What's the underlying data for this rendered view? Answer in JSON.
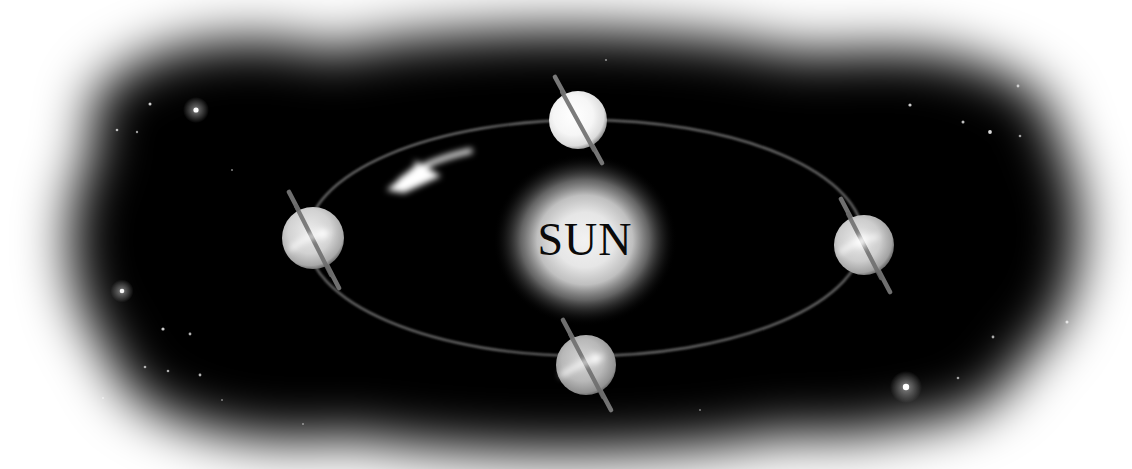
{
  "diagram": {
    "background_color": "#ffffff",
    "space_color": "#000000",
    "sun": {
      "label": "SUN",
      "label_color": "#0a0a0a",
      "cx": 585,
      "cy": 240,
      "core_radius": 52,
      "glow_radius": 92,
      "core_color": "#e8e8e8",
      "glow_color": "#000000"
    },
    "orbit": {
      "name": "orbital-path",
      "cx": 585,
      "cy": 238,
      "rx": 278,
      "ry": 118,
      "stroke_color": "#6d6d6d",
      "stroke_width": 2.4
    },
    "orbit_direction_arrow": {
      "name": "orbit-direction-arrow",
      "label": "counterclockwise",
      "color": "#ffffff"
    },
    "planets": [
      {
        "name": "planet-top",
        "position": "top",
        "cx": 578,
        "cy": 120,
        "r": 29,
        "body_color": "#fdfdfd",
        "axis_color": "#767676",
        "axis_tilt_deg": 22,
        "has_rotation_arrow": false
      },
      {
        "name": "planet-left",
        "position": "left",
        "cx": 313,
        "cy": 238,
        "r": 31,
        "body_color": "#d3d3d3",
        "axis_color": "#6f6f6f",
        "axis_tilt_deg": 22,
        "has_rotation_arrow": true
      },
      {
        "name": "planet-bottom",
        "position": "bottom",
        "cx": 586,
        "cy": 365,
        "r": 30,
        "body_color": "#b6b6b6",
        "axis_color": "#6f6f6f",
        "axis_tilt_deg": 22,
        "has_rotation_arrow": true
      },
      {
        "name": "planet-right",
        "position": "right",
        "cx": 864,
        "cy": 245,
        "r": 30,
        "body_color": "#cfcfcf",
        "axis_color": "#6f6f6f",
        "axis_tilt_deg": 22,
        "has_rotation_arrow": true
      }
    ],
    "stars": [
      {
        "x": 196,
        "y": 110,
        "r": 2.6,
        "bright": 1.0
      },
      {
        "x": 150,
        "y": 104,
        "r": 1.5,
        "bright": 0.8
      },
      {
        "x": 117,
        "y": 130,
        "r": 1.3,
        "bright": 0.7
      },
      {
        "x": 137,
        "y": 132,
        "r": 1.2,
        "bright": 0.6
      },
      {
        "x": 232,
        "y": 170,
        "r": 1.0,
        "bright": 0.5
      },
      {
        "x": 122,
        "y": 291,
        "r": 2.3,
        "bright": 0.95
      },
      {
        "x": 163,
        "y": 329,
        "r": 1.6,
        "bright": 0.8
      },
      {
        "x": 190,
        "y": 334,
        "r": 1.4,
        "bright": 0.7
      },
      {
        "x": 145,
        "y": 367,
        "r": 1.3,
        "bright": 0.65
      },
      {
        "x": 168,
        "y": 371,
        "r": 1.3,
        "bright": 0.65
      },
      {
        "x": 200,
        "y": 375,
        "r": 1.4,
        "bright": 0.7
      },
      {
        "x": 103,
        "y": 398,
        "r": 1.1,
        "bright": 0.5
      },
      {
        "x": 222,
        "y": 400,
        "r": 1.0,
        "bright": 0.45
      },
      {
        "x": 303,
        "y": 424,
        "r": 1.0,
        "bright": 0.45
      },
      {
        "x": 910,
        "y": 105,
        "r": 1.6,
        "bright": 0.8
      },
      {
        "x": 963,
        "y": 122,
        "r": 1.5,
        "bright": 0.75
      },
      {
        "x": 990,
        "y": 132,
        "r": 1.9,
        "bright": 0.85
      },
      {
        "x": 1020,
        "y": 136,
        "r": 1.3,
        "bright": 0.6
      },
      {
        "x": 1018,
        "y": 86,
        "r": 1.4,
        "bright": 0.65
      },
      {
        "x": 1067,
        "y": 322,
        "r": 1.5,
        "bright": 0.7
      },
      {
        "x": 993,
        "y": 337,
        "r": 1.4,
        "bright": 0.65
      },
      {
        "x": 958,
        "y": 378,
        "r": 1.3,
        "bright": 0.6
      },
      {
        "x": 906,
        "y": 387,
        "r": 3.2,
        "bright": 1.0
      },
      {
        "x": 606,
        "y": 60,
        "r": 1.1,
        "bright": 0.5
      },
      {
        "x": 700,
        "y": 410,
        "r": 1.0,
        "bright": 0.45
      }
    ]
  }
}
